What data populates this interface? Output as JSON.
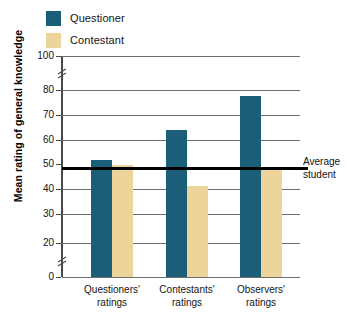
{
  "chart_data": {
    "type": "bar",
    "title": "",
    "xlabel": "",
    "ylabel": "Mean rating of general knowledge",
    "ylim": [
      0,
      100
    ],
    "grid": true,
    "legend_position": "top-left",
    "categories": [
      "Questioners' ratings",
      "Contestants' ratings",
      "Observers' ratings"
    ],
    "series": [
      {
        "name": "Questioner",
        "color": "#1b5e78",
        "values": [
          53,
          66.5,
          82
        ]
      },
      {
        "name": "Contestant",
        "color": "#edd49a",
        "values": [
          50.5,
          41,
          49.5
        ]
      }
    ],
    "yticks": [
      "0",
      "20",
      "30",
      "40",
      "50",
      "60",
      "70",
      "80",
      "100"
    ],
    "axis_breaks": [
      {
        "between": "0-20"
      },
      {
        "between": "80-100"
      }
    ],
    "annotations": [
      {
        "name": "average-student-line",
        "value": 50,
        "line1": "Average",
        "line2": "student"
      }
    ]
  },
  "legend": {
    "items": [
      {
        "label": "Questioner",
        "color": "#1b5e78"
      },
      {
        "label": "Contestant",
        "color": "#edd49a"
      }
    ]
  },
  "axis": {
    "y_title": "Mean rating of general knowledge",
    "ticks": {
      "t0": "0",
      "t20": "20",
      "t30": "30",
      "t40": "40",
      "t50": "50",
      "t60": "60",
      "t70": "70",
      "t80": "80",
      "t100": "100"
    }
  },
  "categories": {
    "c0_line1": "Questioners'",
    "c0_line2": "ratings",
    "c1_line1": "Contestants'",
    "c1_line2": "ratings",
    "c2_line1": "Observers'",
    "c2_line2": "ratings"
  },
  "annotation": {
    "avg_line1": "Average",
    "avg_line2": "student"
  }
}
